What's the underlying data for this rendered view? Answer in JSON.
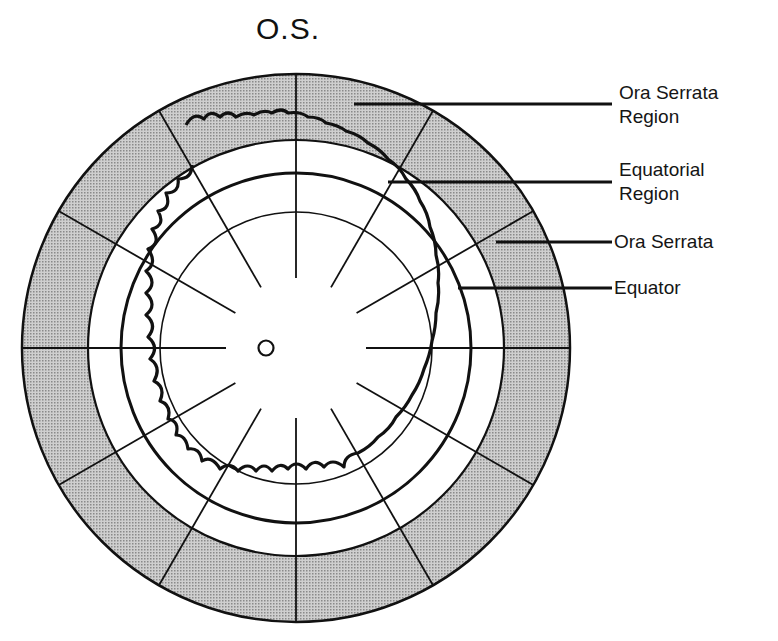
{
  "title": "O.S.",
  "labels": [
    {
      "id": "ora-serrata-region",
      "line1": "Ora Serrata",
      "line2": "Region"
    },
    {
      "id": "equatorial-region",
      "line1": "Equatorial",
      "line2": "Region"
    },
    {
      "id": "ora-serrata",
      "line1": "Ora Serrata",
      "line2": ""
    },
    {
      "id": "equator",
      "line1": "Equator",
      "line2": ""
    }
  ],
  "diagram": {
    "type": "fundus-chart",
    "eye": "left (O.S.)",
    "center": [
      296,
      348
    ],
    "rings_radius_px": {
      "outer_border": 274,
      "ora_serrata_region_inner": 208,
      "equator": 175,
      "inner_circle": 136
    },
    "radial_meridians": 12,
    "optic_disc": "small circle at center",
    "shaded_band": "Ora Serrata Region (stippled gray)",
    "colors": {
      "shade": "#b9b9b9",
      "line": "#111111",
      "background": "#ffffff"
    }
  }
}
